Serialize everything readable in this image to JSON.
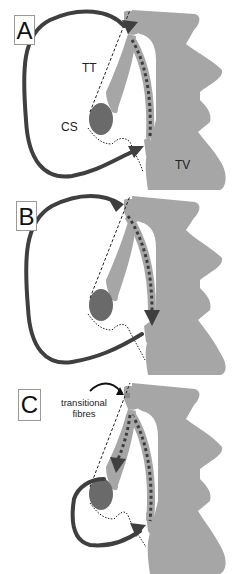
{
  "figure": {
    "panels": [
      {
        "id": "A",
        "letter": "A",
        "labels": {
          "tt": "TT",
          "cs": "CS",
          "tv": "TV"
        }
      },
      {
        "id": "B",
        "letter": "B"
      },
      {
        "id": "C",
        "letter": "C",
        "labels": {
          "annotation": "transitional fibres",
          "annotation_line1": "transitional",
          "annotation_line2": "fibres"
        }
      }
    ],
    "colors": {
      "tissue": "#a6a6a6",
      "coronary_sinus": "#6a6a6a",
      "arrow": "#3f3f3f",
      "dotted_path": "#444444",
      "background": "#ffffff"
    },
    "legend_terms": [
      "TT",
      "CS",
      "TV"
    ]
  }
}
